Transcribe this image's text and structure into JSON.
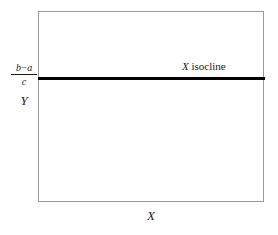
{
  "figure": {
    "type": "phase-plane-diagram",
    "background_color": "#ffffff",
    "frame_color": "#9a9a9a",
    "isocline_color": "#000000",
    "text_color": "#1a1a1a"
  },
  "axes": {
    "x_label": "X",
    "y_label": "Y",
    "y_tick": {
      "numerator": "b−a",
      "denominator": "c"
    }
  },
  "annotations": {
    "isocline": {
      "variable": "X",
      "word": " isocline"
    }
  },
  "chart_data": {
    "type": "line",
    "title": "",
    "xlabel": "X",
    "ylabel": "Y",
    "xlim": [
      0,
      1
    ],
    "ylim": [
      0,
      1
    ],
    "grid": false,
    "legend": "none",
    "series": [
      {
        "name": "X isocline",
        "orientation": "horizontal",
        "y_value_label": "(b−a)/c",
        "x": [
          0,
          1
        ],
        "y": [
          0.655,
          0.655
        ],
        "color": "#000000",
        "linewidth": 3
      }
    ],
    "annotations": [
      {
        "text": "X isocline",
        "x": 0.64,
        "y": 0.72
      }
    ],
    "tick_labels": {
      "y": [
        "(b−a)/c"
      ],
      "x": []
    }
  }
}
